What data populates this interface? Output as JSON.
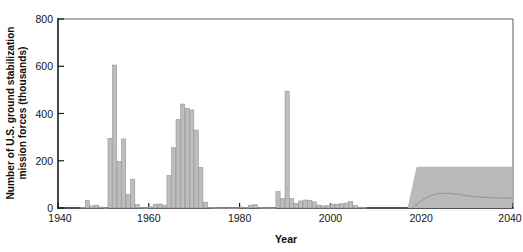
{
  "chart_data": {
    "type": "bar",
    "title": "",
    "xlabel": "Year",
    "ylabel": "Number of U.S. ground stabilization mission forces (thousands)",
    "ylabel_line1": "Number of U.S. ground stabilization",
    "ylabel_line2": "mission forces (thousands)",
    "xlim": [
      1940,
      2040
    ],
    "ylim": [
      0,
      800
    ],
    "y_ticks": [
      0,
      200,
      400,
      600,
      800
    ],
    "y_tick_labels": [
      "0",
      "200",
      "400",
      "600",
      "800"
    ],
    "x_ticks": [
      1940,
      1960,
      1980,
      2000,
      2020,
      2040
    ],
    "x_tick_labels": [
      "1940",
      "1960",
      "1980",
      "2000",
      "2020",
      "2040"
    ],
    "grid": false,
    "legend": null,
    "bar_color": "#bdbdbd",
    "bar_edge_color": "#8f8f8f",
    "band_color": "#b9b9b9",
    "x": [
      1945,
      1946,
      1947,
      1948,
      1949,
      1950,
      1951,
      1952,
      1953,
      1954,
      1955,
      1956,
      1957,
      1958,
      1959,
      1960,
      1961,
      1962,
      1963,
      1964,
      1965,
      1966,
      1967,
      1968,
      1969,
      1970,
      1971,
      1972,
      1973,
      1974,
      1975,
      1976,
      1977,
      1978,
      1979,
      1980,
      1981,
      1982,
      1983,
      1984,
      1985,
      1986,
      1987,
      1988,
      1989,
      1990,
      1991,
      1992,
      1993,
      1994,
      1995,
      1996,
      1997,
      1998,
      1999,
      2000,
      2001,
      2002,
      2003,
      2004,
      2005,
      2006,
      2007
    ],
    "values": [
      3,
      32,
      9,
      12,
      4,
      2,
      295,
      605,
      197,
      292,
      58,
      122,
      14,
      3,
      2,
      5,
      16,
      17,
      12,
      137,
      255,
      375,
      440,
      422,
      415,
      330,
      172,
      25,
      3,
      2,
      1,
      1,
      1,
      1,
      1,
      4,
      3,
      12,
      14,
      3,
      2,
      1,
      1,
      70,
      40,
      495,
      40,
      20,
      30,
      34,
      32,
      26,
      12,
      9,
      10,
      17,
      16,
      18,
      21,
      28,
      10,
      4,
      3
    ],
    "projection_band": {
      "label": "projected range",
      "x_start": 2018,
      "x_end": 2040,
      "y_top": 175,
      "y_bottom": 0,
      "ramp_start": 2017,
      "ramp_end": 2019,
      "center_curve_x": [
        2018,
        2020,
        2022,
        2024,
        2026,
        2028,
        2030,
        2032,
        2034,
        2036,
        2038,
        2040
      ],
      "center_curve_y": [
        0,
        30,
        52,
        62,
        62,
        58,
        52,
        48,
        45,
        43,
        42,
        42
      ]
    }
  },
  "axes": {
    "x_title": "Year",
    "y_title_line1": "Number of U.S. ground stabilization",
    "y_title_line2": "mission forces (thousands)"
  },
  "caption": {
    "cropped_text": ""
  }
}
